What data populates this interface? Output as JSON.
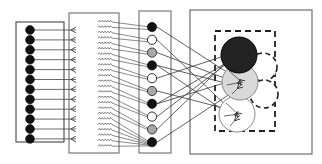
{
  "figure": {
    "type": "network-architecture-diagram",
    "title": "",
    "canvas": {
      "width": 322,
      "height": 164
    },
    "background_color": "#ffffff",
    "stroke_color": "#231f20",
    "colors": {
      "black_node": "#1a1a1a",
      "white_node": "#ffffff",
      "gray_node": "#a8a8a8",
      "light_gray_node": "#d9d9d9",
      "panel_border": "#6d6d6d",
      "dashed_border": "#231f20",
      "edge": "#3a3a3a"
    }
  },
  "panels": [
    {
      "id": "input-panel",
      "name": "input-layer-panel",
      "label": "",
      "x": 16,
      "y": 22,
      "width": 48,
      "height": 120,
      "border_style": "solid",
      "border_color": "#444444"
    },
    {
      "id": "hidden-panel",
      "name": "hidden-layer-panel",
      "label": "",
      "x": 69,
      "y": 13,
      "width": 48,
      "height": 140,
      "border_style": "solid",
      "border_color": "#6d6d6d"
    },
    {
      "id": "squiggle-panel",
      "name": "weight-matrix-panel",
      "label": "",
      "x": 97,
      "y": 13,
      "width": 22,
      "height": 140,
      "border_style": "none",
      "border_color": "#6d6d6d"
    },
    {
      "id": "output-panel",
      "name": "output-layer-panel",
      "label": "",
      "x": 139,
      "y": 11,
      "width": 32,
      "height": 142,
      "border_style": "solid",
      "border_color": "#6d6d6d"
    },
    {
      "id": "result-panel",
      "name": "result-panel",
      "label": "",
      "x": 190,
      "y": 10,
      "width": 122,
      "height": 144,
      "border_style": "solid",
      "border_color": "#6d6d6d"
    },
    {
      "id": "cluster-box",
      "name": "cluster-dashed-box",
      "label": "",
      "x": 215,
      "y": 31,
      "width": 60,
      "height": 100,
      "border_style": "dashed",
      "border_color": "#231f20"
    }
  ],
  "layers": {
    "input": {
      "name": "input-nodes",
      "count": 12,
      "node_radius": 4.4,
      "x": 30,
      "y_start": 30,
      "y_step": 9.9,
      "nodes": [
        {
          "index": 0,
          "fill": "black"
        },
        {
          "index": 1,
          "fill": "black"
        },
        {
          "index": 2,
          "fill": "black"
        },
        {
          "index": 3,
          "fill": "black"
        },
        {
          "index": 4,
          "fill": "black"
        },
        {
          "index": 5,
          "fill": "black"
        },
        {
          "index": 6,
          "fill": "black"
        },
        {
          "index": 7,
          "fill": "black"
        },
        {
          "index": 8,
          "fill": "black"
        },
        {
          "index": 9,
          "fill": "black"
        },
        {
          "index": 10,
          "fill": "black"
        },
        {
          "index": 11,
          "fill": "black"
        }
      ]
    },
    "arrowheads": {
      "name": "hidden-layer-arrow-markers",
      "count": 12,
      "x": 75,
      "y_start": 30,
      "y_step": 9.9
    },
    "squiggles": {
      "name": "weight-squiggle-marks",
      "count": 24,
      "x": 98,
      "y_start": 24,
      "y_step": 5.4,
      "width": 14
    },
    "output": {
      "name": "output-nodes",
      "count": 10,
      "node_radius": 4.6,
      "x": 152,
      "y_start": 27,
      "y_step": 12.8,
      "nodes": [
        {
          "index": 0,
          "fill": "black"
        },
        {
          "index": 1,
          "fill": "white"
        },
        {
          "index": 2,
          "fill": "gray"
        },
        {
          "index": 3,
          "fill": "black"
        },
        {
          "index": 4,
          "fill": "white"
        },
        {
          "index": 5,
          "fill": "gray"
        },
        {
          "index": 6,
          "fill": "black"
        },
        {
          "index": 7,
          "fill": "white"
        },
        {
          "index": 8,
          "fill": "gray"
        },
        {
          "index": 9,
          "fill": "black"
        }
      ]
    },
    "clusters": {
      "name": "cluster-circles",
      "circles": [
        {
          "id": "c1",
          "name": "cluster-black-circle",
          "cx": 239,
          "cy": 55,
          "r": 18,
          "fill": "black",
          "border_style": "solid"
        },
        {
          "id": "c2",
          "name": "cluster-dashed-circle-upper",
          "cx": 263,
          "cy": 67,
          "r": 14,
          "fill": "none",
          "border_style": "dashed"
        },
        {
          "id": "c3",
          "name": "cluster-gray-circle",
          "cx": 240,
          "cy": 82,
          "r": 18,
          "fill": "lightgray",
          "border_style": "solid"
        },
        {
          "id": "c4",
          "name": "cluster-dashed-circle-lower",
          "cx": 264,
          "cy": 94,
          "r": 14,
          "fill": "none",
          "border_style": "dashed"
        },
        {
          "id": "c5",
          "name": "cluster-white-circle",
          "cx": 237,
          "cy": 114,
          "r": 18,
          "fill": "white",
          "border_style": "solid"
        }
      ]
    }
  },
  "connections": {
    "input_to_hidden": {
      "name": "input-to-hidden-edges",
      "count": 12,
      "description": "horizontal parallel lines from each input node to an arrowhead"
    },
    "hidden_to_output": {
      "name": "hidden-to-output-edges",
      "count": 24,
      "description": "parallel lines converging from the weight panel to the output node column"
    },
    "output_to_cluster": {
      "name": "output-to-cluster-edges",
      "pairs": [
        {
          "from": 0,
          "to": "c3"
        },
        {
          "from": 1,
          "to": "c5"
        },
        {
          "from": 2,
          "to": "c3"
        },
        {
          "from": 3,
          "to": "c5"
        },
        {
          "from": 3,
          "to": "c3"
        },
        {
          "from": 4,
          "to": "c1"
        },
        {
          "from": 5,
          "to": "c5"
        },
        {
          "from": 6,
          "to": "c3"
        },
        {
          "from": 6,
          "to": "c1"
        },
        {
          "from": 7,
          "to": "c1"
        },
        {
          "from": 8,
          "to": "c1"
        },
        {
          "from": 9,
          "to": "c3"
        }
      ]
    }
  }
}
